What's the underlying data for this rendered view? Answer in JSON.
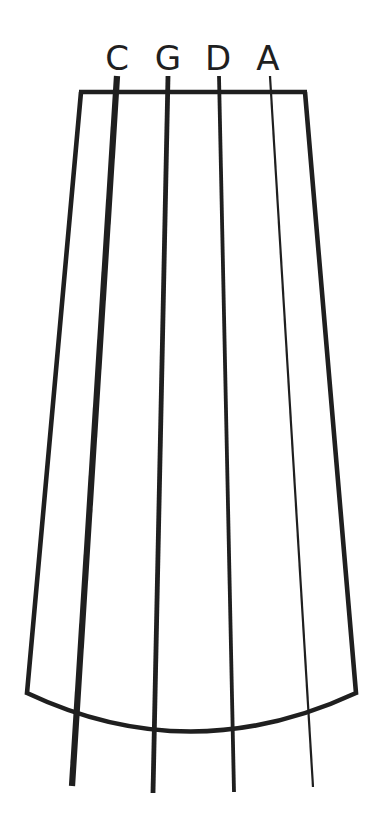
{
  "diagram": {
    "type": "string-instrument-fingerboard",
    "instrument": "cello",
    "background_color": "#ffffff",
    "ink_color": "#1f1f1f",
    "canvas": {
      "width": 381,
      "height": 834
    },
    "labels": {
      "c": "C",
      "g": "G",
      "d": "D",
      "a": "A"
    },
    "strings": [
      {
        "name": "C",
        "label": "C",
        "order": 1,
        "role": "lowest-pitch-thickest",
        "stroke_width": 6.2,
        "label_x": 117,
        "label_baseline_y": 70,
        "top_x": 117,
        "top_y": 76,
        "bottom_x": 72,
        "bottom_y": 786
      },
      {
        "name": "G",
        "label": "G",
        "order": 2,
        "role": "second-string",
        "stroke_width": 4.8,
        "label_x": 168,
        "label_baseline_y": 70,
        "top_x": 168,
        "top_y": 76,
        "bottom_x": 153,
        "bottom_y": 793
      },
      {
        "name": "D",
        "label": "D",
        "order": 3,
        "role": "third-string",
        "stroke_width": 3.8,
        "label_x": 218,
        "label_baseline_y": 70,
        "top_x": 219,
        "top_y": 76,
        "bottom_x": 234,
        "bottom_y": 792
      },
      {
        "name": "A",
        "label": "A",
        "order": 4,
        "role": "highest-pitch-thinnest",
        "stroke_width": 2.2,
        "label_x": 268,
        "label_baseline_y": 70,
        "top_x": 270,
        "top_y": 76,
        "bottom_x": 313,
        "bottom_y": 787
      }
    ],
    "fingerboard": {
      "nut_y": 92,
      "nut_left_x": 81,
      "nut_right_x": 305,
      "bottom_left_x": 27,
      "bottom_right_x": 356,
      "bottom_edge_y": 693,
      "bottom_arc_center_x": 190,
      "bottom_arc_center_y": 739,
      "outline_stroke_width": 4.6,
      "nut_stroke_width": 4.6
    }
  }
}
